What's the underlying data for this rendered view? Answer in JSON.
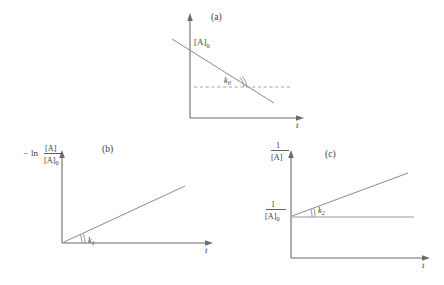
{
  "figure": {
    "background_color": "#ffffff",
    "line_color": "#8a8a8a",
    "axis_color": "#6b6b6b",
    "text_color": "#3a3a3a"
  },
  "panels": [
    {
      "id": "a",
      "label": "(a)",
      "order_name": "zero-order",
      "y_axis_label": "[A]",
      "y_axis_label_plain": "[A]",
      "x_axis_label": "t",
      "intercept_label": "[A]",
      "intercept_subscript": "0",
      "slope_label": "k",
      "slope_subscript": "0",
      "trend": "decreasing",
      "has_dashed_reference_line": true,
      "has_angle_arc": true
    },
    {
      "id": "b",
      "label": "(b)",
      "order_name": "first-order",
      "y_axis_minus": "−",
      "y_axis_ln": "ln",
      "y_axis_numerator": "[A]",
      "y_axis_denominator": "[A]",
      "y_axis_denominator_subscript": "0",
      "x_axis_label": "t",
      "slope_label": "k",
      "slope_subscript": "1",
      "trend": "increasing",
      "has_dashed_reference_line": false,
      "has_angle_arc": true,
      "intercept_at_origin": true
    },
    {
      "id": "c",
      "label": "(c)",
      "order_name": "second-order",
      "y_axis_numerator": "1",
      "y_axis_denominator": "[A]",
      "x_axis_label": "t",
      "intercept_numerator": "1",
      "intercept_denominator": "[A]",
      "intercept_denominator_subscript": "0",
      "slope_label": "k",
      "slope_subscript": "2",
      "trend": "increasing",
      "has_solid_reference_line": true,
      "has_angle_arc": true
    }
  ]
}
